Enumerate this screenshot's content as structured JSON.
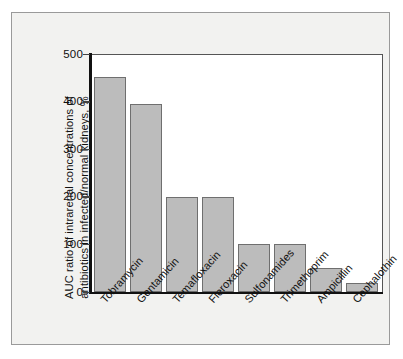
{
  "chart_data": {
    "type": "bar",
    "title": "",
    "subtitle": "",
    "xlabel": "",
    "ylabel": "AUC ratio of intrarenal concentrations of antibiotics in infected/normal kidneys, %",
    "ylabel_lines": [
      "AUC ratio of intrarenal concentrations of",
      "antibiotics in infected/normal kidneys, %"
    ],
    "categories": [
      "Tobramycin",
      "Gentamicin",
      "Temafloxacin",
      "Fleroxacin",
      "Sulfonamides",
      "Trimethoprim",
      "Ampicillin",
      "Cephalothin"
    ],
    "values": [
      452,
      396,
      199,
      199,
      100,
      101,
      50,
      20
    ],
    "ylim": [
      0,
      500
    ],
    "yticks": [
      0,
      100,
      200,
      300,
      400,
      500
    ],
    "ytick_labels": [
      "0",
      "100",
      "200",
      "300",
      "400",
      "500"
    ],
    "grid": false,
    "legend": "none",
    "bar_color": "#bcbcbc",
    "bar_edge_color": "#6f6f6f",
    "axis_color": "#111111",
    "panel_background": "#f2f2f0",
    "plot_background": "#ffffff",
    "frame_color": "#9a9a9a"
  }
}
